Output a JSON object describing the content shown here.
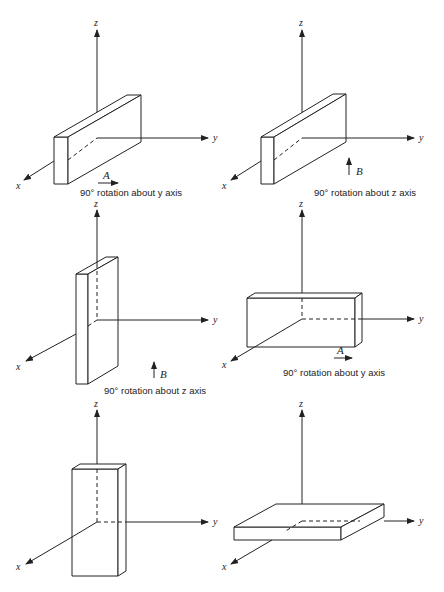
{
  "figure": {
    "axis_labels": {
      "x": "x",
      "y": "y",
      "z": "z"
    },
    "panels": [
      {
        "id": "p1",
        "position": "top-left",
        "orientation": "long along y, thin in x, short in z",
        "caption": "90° rotation about y axis",
        "arrow_label": "A",
        "arrow_direction": "right"
      },
      {
        "id": "p2",
        "position": "top-right",
        "orientation": "long along y, thin in x, short in z",
        "caption": "90° rotation about z axis",
        "arrow_label": "B",
        "arrow_direction": "up"
      },
      {
        "id": "p3",
        "position": "middle-left",
        "orientation": "tall along z, thin in x",
        "caption": "90° rotation about z axis",
        "arrow_label": "B",
        "arrow_direction": "up"
      },
      {
        "id": "p4",
        "position": "middle-right",
        "orientation": "long along y, thin in x, medium in z",
        "caption": "90° rotation about y axis",
        "arrow_label": "A",
        "arrow_direction": "right"
      },
      {
        "id": "p5",
        "position": "bottom-left",
        "orientation": "tall along z, thick in x"
      },
      {
        "id": "p6",
        "position": "bottom-right",
        "orientation": "flat slab in x-y plane"
      }
    ]
  }
}
